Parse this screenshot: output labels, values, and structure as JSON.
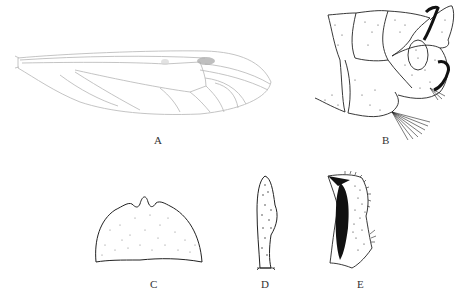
{
  "figure": {
    "panels": [
      {
        "id": "A",
        "label": "A",
        "subject": "wing"
      },
      {
        "id": "B",
        "label": "B",
        "subject": "terminalia-lateral-view"
      },
      {
        "id": "C",
        "label": "C",
        "subject": "sclerite-plate"
      },
      {
        "id": "D",
        "label": "D",
        "subject": "appendage-elongate"
      },
      {
        "id": "E",
        "label": "E",
        "subject": "gonostylus"
      }
    ]
  },
  "colors": {
    "background": "#ffffff",
    "ink": "#222222",
    "wing_vein": "#b8b8b8",
    "stigma": "#9a9a9a"
  }
}
